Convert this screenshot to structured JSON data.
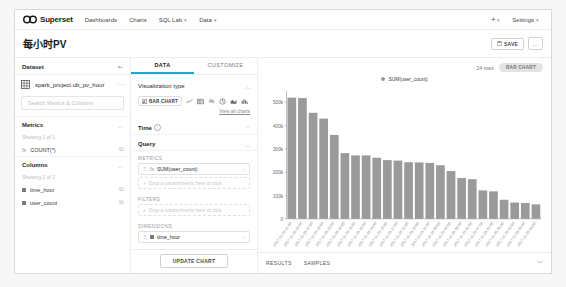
{
  "navbar": {
    "brand": "Superset",
    "links": [
      {
        "label": "Dashboards",
        "caret": false
      },
      {
        "label": "Charts",
        "caret": false
      },
      {
        "label": "SQL Lab",
        "caret": true
      },
      {
        "label": "Data",
        "caret": true
      }
    ],
    "plus_label": "+",
    "settings_label": "Settings"
  },
  "titlebar": {
    "title": "每小时PV",
    "save_label": "SAVE",
    "more_label": "..."
  },
  "dataset_panel": {
    "header": "Dataset",
    "dataset_name": "spark_project.ub_pv_hour",
    "search_placeholder": "Search Metrics & Columns",
    "metrics": {
      "title": "Metrics",
      "showing": "Showing 1 of 1",
      "items": [
        {
          "icon": "fx",
          "label": "COUNT(*)"
        }
      ]
    },
    "columns": {
      "title": "Columns",
      "showing": "Showing 2 of 2",
      "items": [
        {
          "label": "time_hour"
        },
        {
          "label": "user_count"
        }
      ]
    }
  },
  "control_panel": {
    "tabs": [
      {
        "label": "DATA",
        "active": true
      },
      {
        "label": "CUSTOMIZE",
        "active": false
      }
    ],
    "viz_type_section": "Visualization type",
    "viz_type_selected": "BAR CHART",
    "view_all_charts": "View all charts",
    "time_section": "Time",
    "query_section": "Query",
    "metrics_label": "METRICS",
    "metric_chip": "SUM(user_count)",
    "metric_dropzone": "Drop a column/metric here or click",
    "filters_label": "FILTERS",
    "filters_dropzone": "Drop a column/metric here or click",
    "dimensions_label": "DIMENSIONS",
    "dimension_chip": "time_hour",
    "update_chart_label": "UPDATE CHART"
  },
  "chart_panel": {
    "rows_count": "24 rows",
    "viz_pill": "BAR CHART",
    "legend": "SUM(user_count)",
    "bottom_tabs": [
      {
        "label": "RESULTS"
      },
      {
        "label": "SAMPLES"
      }
    ]
  },
  "colors": {
    "bar": "#9a9a9a",
    "accent": "#20a7c9",
    "axis": "#999999",
    "grid": "#eeeeee"
  },
  "chart_data": {
    "type": "bar",
    "title": "",
    "xlabel": "",
    "ylabel": "",
    "ylim": [
      0,
      550000
    ],
    "grid": false,
    "legend": "SUM(user_count)",
    "legend_position": "top-center",
    "ytick_labels": [
      "0",
      "100k",
      "200k",
      "300k",
      "400k",
      "500k"
    ],
    "ytick_values": [
      0,
      100000,
      200000,
      300000,
      400000,
      500000
    ],
    "categories": [
      "2017-11-25 21:00",
      "2017-11-25 20:00",
      "2017-11-25 22:00",
      "2017-11-25 19:00",
      "2017-11-25 23:00",
      "2017-11-25 18:00",
      "2017-11-25 15:00",
      "2017-11-25 16:00",
      "2017-11-25 14:00",
      "2017-11-25 13:00",
      "2017-11-25 17:00",
      "2017-11-25 12:00",
      "2017-11-25 10:00",
      "2017-11-25 11:00",
      "2017-11-25 09:00",
      "2017-11-25 00:00",
      "2017-11-25 08:00",
      "2017-11-25 01:00",
      "2017-11-25 07:00",
      "2017-11-25 02:00",
      "2017-11-25 06:00",
      "2017-11-25 03:00",
      "2017-11-25 05:00",
      "2017-11-25 04:00"
    ],
    "series": [
      {
        "name": "SUM(user_count)",
        "values": [
          520000,
          518000,
          455000,
          430000,
          360000,
          282000,
          272000,
          272000,
          262000,
          252000,
          250000,
          243000,
          242000,
          240000,
          230000,
          205000,
          175000,
          170000,
          122000,
          118000,
          82000,
          70000,
          68000,
          62000
        ]
      }
    ]
  }
}
